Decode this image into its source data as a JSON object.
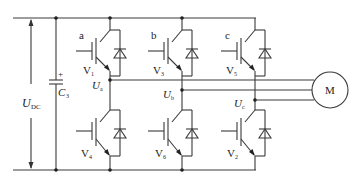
{
  "diagram": {
    "type": "three-phase-inverter-circuit",
    "dc_voltage": {
      "label": "U",
      "sub": "DC"
    },
    "capacitor": {
      "label": "C",
      "sub": "3",
      "polarity": "+"
    },
    "legs": [
      {
        "name": "a",
        "upper": {
          "label": "V",
          "sub": "1"
        },
        "lower": {
          "label": "V",
          "sub": "4"
        },
        "node": {
          "label": "U",
          "sub": "a"
        }
      },
      {
        "name": "b",
        "upper": {
          "label": "V",
          "sub": "3"
        },
        "lower": {
          "label": "V",
          "sub": "6"
        },
        "node": {
          "label": "U",
          "sub": "b"
        }
      },
      {
        "name": "c",
        "upper": {
          "label": "V",
          "sub": "5"
        },
        "lower": {
          "label": "V",
          "sub": "2"
        },
        "node": {
          "label": "U",
          "sub": "c"
        }
      }
    ],
    "motor": {
      "label": "M"
    },
    "colors": {
      "wire": "#3a3a3a",
      "background": "#ffffff"
    }
  }
}
